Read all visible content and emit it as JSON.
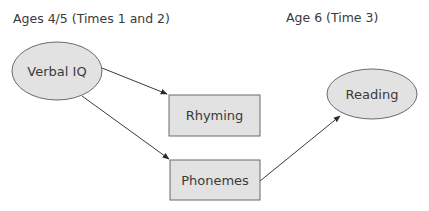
{
  "headers": {
    "left": "Ages 4/5 (Times 1 and 2)",
    "right": "Age 6 (Time 3)"
  },
  "nodes": {
    "verbal_iq": {
      "label": "Verbal IQ",
      "shape": "ellipse"
    },
    "rhyming": {
      "label": "Rhyming",
      "shape": "rectangle"
    },
    "phonemes": {
      "label": "Phonemes",
      "shape": "rectangle"
    },
    "reading": {
      "label": "Reading",
      "shape": "ellipse"
    }
  },
  "edges": [
    {
      "from": "Verbal IQ",
      "to": "Rhyming"
    },
    {
      "from": "Verbal IQ",
      "to": "Phonemes"
    },
    {
      "from": "Phonemes",
      "to": "Reading"
    }
  ],
  "colors": {
    "node_fill": "#e2e2e2",
    "node_stroke": "#6a6a6a",
    "edge": "#3c3c3c",
    "text": "#3a3a3a"
  }
}
